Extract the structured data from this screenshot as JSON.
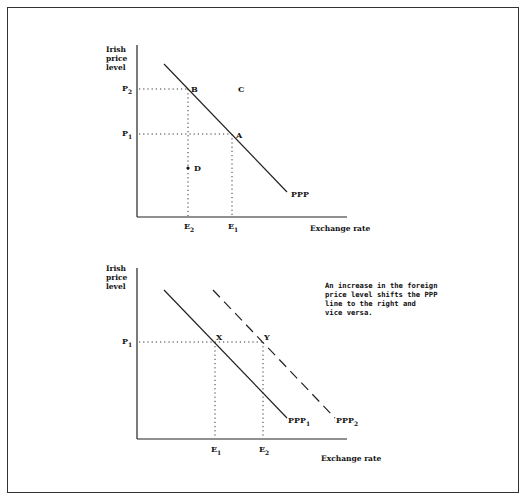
{
  "figure": {
    "panels": [
      {
        "id": "ppp-single",
        "y_axis_label": [
          "Irish",
          "price",
          "level"
        ],
        "x_axis_label": "Exchange rate",
        "line_label": "PPP",
        "price_ticks": [
          {
            "main": "P",
            "sub": "2"
          },
          {
            "main": "P",
            "sub": "1"
          }
        ],
        "rate_ticks": [
          {
            "main": "E",
            "sub": "2"
          },
          {
            "main": "E",
            "sub": "1"
          }
        ],
        "points": {
          "B": "B",
          "C": "C",
          "A": "A",
          "D": "D"
        }
      },
      {
        "id": "ppp-shift",
        "y_axis_label": [
          "Irish",
          "price",
          "level"
        ],
        "x_axis_label": "Exchange rate",
        "line1_label": {
          "main": "PPP",
          "sub": "1"
        },
        "line2_label": {
          "main": "PPP",
          "sub": "2"
        },
        "price_ticks": [
          {
            "main": "P",
            "sub": "1"
          }
        ],
        "rate_ticks": [
          {
            "main": "E",
            "sub": "1"
          },
          {
            "main": "E",
            "sub": "2"
          }
        ],
        "points": {
          "X": "X",
          "Y": "Y"
        },
        "note": [
          "An increase in the foreign",
          "price level shifts the PPP",
          "line to the right and",
          "vice versa."
        ]
      }
    ]
  }
}
